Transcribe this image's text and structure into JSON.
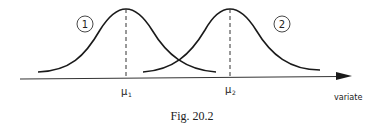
{
  "figure": {
    "caption": "Fig. 20.2",
    "axis_label": "variate",
    "curves": [
      {
        "id": "1",
        "label": "1",
        "mean_symbol": "μ",
        "mean_subscript": "1"
      },
      {
        "id": "2",
        "label": "2",
        "mean_symbol": "μ",
        "mean_subscript": "2"
      }
    ]
  },
  "colors": {
    "line": "#1a1a1a",
    "background": "#ffffff"
  }
}
